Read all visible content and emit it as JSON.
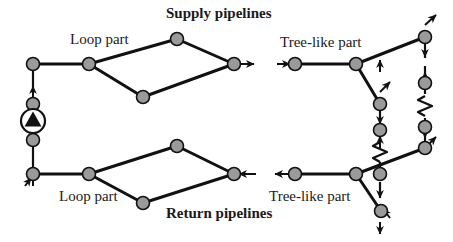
{
  "figure": {
    "kind": "schematic-diagram",
    "background_color": "#ffffff",
    "line_color": "#111111",
    "node_fill_color": "#9a9a9a",
    "node_stroke_color": "#111111",
    "pump_fill_color": "#111111"
  },
  "labels": {
    "supply_pipelines": "Supply pipelines",
    "return_pipelines": "Return pipelines",
    "loop_part_top": "Loop part",
    "loop_part_bottom": "Loop part",
    "tree_like_part_top": "Tree-like part",
    "tree_like_part_bottom": "Tree-like part"
  },
  "symbols": {
    "node": "pipe-junction-node",
    "pump": "circulation-pump-icon",
    "resistor": "heat-exchanger-zigzag-icon",
    "arrow": "flow-direction-arrow"
  },
  "topology": {
    "supply_loop_nodes": 5,
    "return_loop_nodes": 5,
    "supply_tree_nodes": 5,
    "return_tree_nodes": 5,
    "pumps": 1,
    "heat_exchangers": 2
  }
}
